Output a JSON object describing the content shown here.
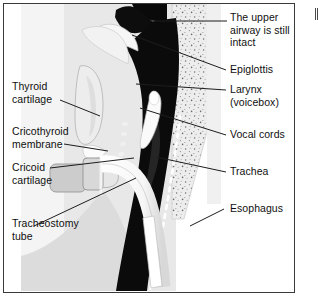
{
  "figure": {
    "frame_color": "#3a3a3a",
    "background": "#ffffff"
  },
  "palette": {
    "airway_dark": "#0b0b0b",
    "soft_tissue": "#e3e3e3",
    "skin_light": "#d6d6d6",
    "cartilage_light": "#f2f2f2",
    "tube_white": "#fdfdfd",
    "flange_gray": "#c9c9c9",
    "spine_speckle": "#eceaea",
    "leader_line": "#1d1d1d",
    "text": "#101010"
  },
  "labels": {
    "upper_airway": {
      "lines": [
        "The upper",
        "airway is still",
        "intact"
      ],
      "text": "The upper\nairway is still\nintact"
    },
    "epiglottis": {
      "text": "Epiglottis"
    },
    "larynx": {
      "lines": [
        "Larynx",
        "(voicebox)"
      ],
      "text": "Larynx\n(voicebox)"
    },
    "vocal_cords": {
      "text": "Vocal cords"
    },
    "trachea": {
      "text": "Trachea"
    },
    "esophagus": {
      "text": "Esophagus"
    },
    "thyroid_cartilage": {
      "lines": [
        "Thyroid",
        "cartilage"
      ],
      "text": "Thyroid\ncartilage"
    },
    "cricothyroid_membrane": {
      "lines": [
        "Cricothyroid",
        "membrane"
      ],
      "text": "Cricothyroid\nmembrane"
    },
    "cricoid_cartilage": {
      "lines": [
        "Cricoid",
        "cartilage"
      ],
      "text": "Cricoid\ncartilage"
    },
    "tracheostomy_tube": {
      "lines": [
        "Tracheostomy",
        "tube"
      ],
      "text": "Tracheostomy\ntube"
    }
  }
}
